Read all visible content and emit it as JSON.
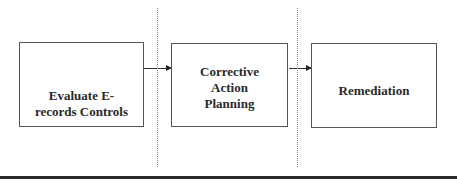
{
  "diagram": {
    "type": "process-flow",
    "steps": [
      {
        "id": "step-1",
        "label": "Evaluate E-\nrecords Controls"
      },
      {
        "id": "step-2",
        "label": "Corrective\nAction\nPlanning"
      },
      {
        "id": "step-3",
        "label": "Remediation"
      }
    ],
    "connections": [
      {
        "from": "step-1",
        "to": "step-2"
      },
      {
        "from": "step-2",
        "to": "step-3"
      }
    ],
    "colors": {
      "box_border": "#555555",
      "text": "#2a2a2a",
      "arrow": "#333333",
      "divider": "#8a8a8a",
      "bottom_rule": "#2b2b2b",
      "background": "#ffffff"
    }
  }
}
